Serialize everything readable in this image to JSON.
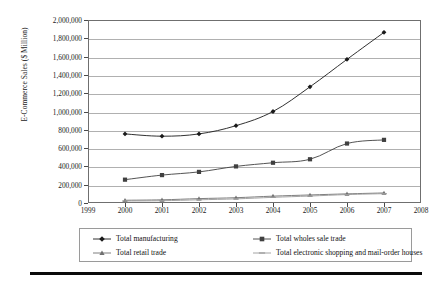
{
  "chart_data": {
    "type": "line",
    "title": "",
    "xlabel": "",
    "ylabel": "E-Commerce Sales ($ Million)",
    "x": [
      2000,
      2001,
      2002,
      2003,
      2004,
      2005,
      2006,
      2007
    ],
    "xlim": [
      1999,
      2008
    ],
    "ylim": [
      0,
      2000000
    ],
    "grid": true,
    "legend_position": "bottom",
    "x_tick_labels": [
      "1999",
      "2000",
      "2001",
      "2002",
      "2003",
      "2004",
      "2005",
      "2006",
      "2007",
      "2008"
    ],
    "y_tick_labels": [
      "0",
      "200,000",
      "400,000",
      "600,000",
      "800,000",
      "1,000,000",
      "1,200,000",
      "1,400,000",
      "1,600,000",
      "1,800,000",
      "2,000,000"
    ],
    "y_tick_values": [
      0,
      200000,
      400000,
      600000,
      800000,
      1000000,
      1200000,
      1400000,
      1600000,
      1800000,
      2000000
    ],
    "series": [
      {
        "name": "Total manufacturing",
        "marker": "diamond",
        "color": "#1a1a1a",
        "values": [
          755000,
          730000,
          755000,
          845000,
          1000000,
          1270000,
          1570000,
          1865000
        ]
      },
      {
        "name": "Total wholes sale trade",
        "marker": "square",
        "color": "#404040",
        "values": [
          255000,
          305000,
          340000,
          400000,
          440000,
          478000,
          650000,
          690000
        ]
      },
      {
        "name": "Total retail trade",
        "marker": "triangle",
        "color": "#707070",
        "values": [
          30000,
          35000,
          48000,
          58000,
          75000,
          88000,
          100000,
          110000
        ]
      },
      {
        "name": "Total electronic shopping and mail-order houses",
        "marker": "dash",
        "color": "#9a9a9a",
        "values": [
          22000,
          25000,
          35000,
          45000,
          62000,
          76000,
          92000,
          102000
        ]
      }
    ]
  },
  "legend": {
    "entries": [
      {
        "label": "Total manufacturing"
      },
      {
        "label": "Total wholes sale trade"
      },
      {
        "label": "Total retail trade"
      },
      {
        "label": "Total electronic shopping and mail-order houses"
      }
    ]
  }
}
